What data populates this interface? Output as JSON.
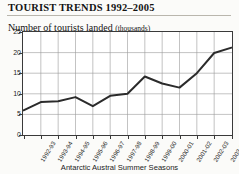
{
  "title": "TOURIST TRENDS 1992–2005",
  "subtitle_main": "Number of tourists landed",
  "subtitle_unit": "(thousands)",
  "chart_data": {
    "type": "line",
    "title": "Number of tourists landed (thousands)",
    "xlabel": "Antarctic Austral Summer Seasons",
    "ylabel": "",
    "ylim": [
      0,
      25
    ],
    "yticks": [
      0,
      5,
      10,
      15,
      20,
      25
    ],
    "ytick_labels": [
      "0",
      "5",
      "10",
      "15",
      "20",
      "25"
    ],
    "grid": true,
    "legend": false,
    "line_color": "#2b2b2b",
    "categories": [
      "1992-93",
      "1993-94",
      "1994-95",
      "1995-96",
      "1996-97",
      "1997-98",
      "1998-99",
      "1999-00",
      "2000-01",
      "2001-02",
      "2002-03",
      "2003-04",
      "2004-05"
    ],
    "values": [
      6.0,
      8.0,
      8.2,
      9.2,
      7.0,
      9.5,
      10.0,
      14.2,
      12.5,
      11.5,
      15.0,
      19.9,
      21.2
    ]
  }
}
